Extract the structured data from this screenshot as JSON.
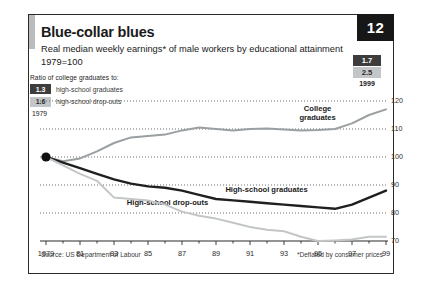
{
  "badge": "12",
  "title": "Blue-collar blues",
  "subtitle_line1": "Real median weekly earnings* of male workers by educational attainment",
  "subtitle_line2": "1979=100",
  "legend": {
    "heading": "Ratio of college graduates to:",
    "items": [
      {
        "value": "1.3",
        "label": "high-school graduates",
        "style": "dark"
      },
      {
        "value": "1.6",
        "label": "high-school drop-outs",
        "style": "light"
      }
    ],
    "year": "1979"
  },
  "right_chips": {
    "items": [
      {
        "value": "1.7",
        "style": "dark"
      },
      {
        "value": "2.5",
        "style": "light"
      }
    ],
    "year": "1999"
  },
  "source": "Source: US Department of Labour",
  "footnote": "*Deflated by consumer prices",
  "series_labels": {
    "college": "College\ngraduates",
    "college_l1": "College",
    "college_l2": "graduates",
    "hs_grads": "High-school graduates",
    "dropouts": "High-school drop-outs"
  },
  "colors": {
    "college_line": "#9a9fa2",
    "hs_grad_line": "#1f1f1f",
    "dropout_line": "#c3c6c8",
    "badge_bg": "#171717",
    "chip_dark": "#3d3d3d",
    "chip_light": "#c3c6c8",
    "axis": "#2b2b2b",
    "grid": "#4a4a4a"
  },
  "chart_data": {
    "type": "line",
    "title": "Blue-collar blues",
    "subtitle": "Real median weekly earnings* of male workers by educational attainment, 1979=100",
    "xlabel": "",
    "ylabel": "Index, 1979=100",
    "xlim": [
      1979,
      1999
    ],
    "ylim": [
      70,
      120
    ],
    "yticks": [
      70,
      80,
      90,
      100,
      110,
      120
    ],
    "xticks": [
      1979,
      1981,
      1983,
      1985,
      1987,
      1989,
      1991,
      1993,
      1995,
      1997,
      1999
    ],
    "xtick_labels": [
      "1979",
      "81",
      "83",
      "85",
      "87",
      "89",
      "91",
      "93",
      "95",
      "97",
      "99"
    ],
    "grid": "horizontal-dotted",
    "legend": "inline-labels",
    "x": [
      1979,
      1980,
      1981,
      1982,
      1983,
      1984,
      1985,
      1986,
      1987,
      1988,
      1989,
      1990,
      1991,
      1992,
      1993,
      1994,
      1995,
      1996,
      1997,
      1998,
      1999
    ],
    "series": [
      {
        "name": "College graduates",
        "color": "#9a9fa2",
        "values": [
          100,
          98.5,
          99.5,
          102,
          105,
          107,
          107.5,
          108,
          109.5,
          110.5,
          110,
          109.5,
          110,
          110.2,
          109.8,
          109.5,
          109.6,
          110,
          112,
          115,
          117
        ]
      },
      {
        "name": "High-school graduates",
        "color": "#1f1f1f",
        "values": [
          100,
          98,
          96,
          94,
          92,
          90.5,
          89.5,
          89,
          88,
          86.5,
          85,
          84.5,
          84,
          83.5,
          83,
          82.5,
          82,
          81.5,
          83,
          85.5,
          88
        ]
      },
      {
        "name": "High-school drop-outs",
        "color": "#c3c6c8",
        "values": [
          100,
          97,
          94,
          91.5,
          85.5,
          85,
          84.5,
          83,
          80.5,
          79,
          78,
          76.5,
          75,
          74,
          73.5,
          71.5,
          70,
          70.2,
          70.5,
          71.5,
          71.5
        ]
      }
    ],
    "annotations": [
      {
        "text": "Start point 1979=100",
        "x": 1979,
        "y": 100,
        "marker": "filled-circle"
      },
      {
        "text": "Ratio of college graduates to high-school graduates 1979",
        "value": "1.3"
      },
      {
        "text": "Ratio of college graduates to high-school drop-outs 1979",
        "value": "1.6"
      },
      {
        "text": "Ratio of college graduates to high-school graduates 1999",
        "value": "1.7"
      },
      {
        "text": "Ratio of college graduates to high-school drop-outs 1999",
        "value": "2.5"
      }
    ]
  }
}
